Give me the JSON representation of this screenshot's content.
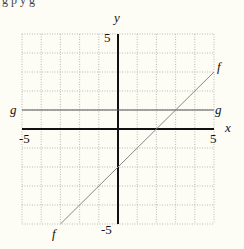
{
  "header_fragment": "g         p                     y   g",
  "chart_data": {
    "type": "line",
    "title": "",
    "xlabel": "x",
    "ylabel": "y",
    "xlim": [
      -5,
      5
    ],
    "ylim": [
      -5,
      5
    ],
    "grid": true,
    "tick_labels": {
      "x_min": "-5",
      "x_max": "5",
      "y_min": "-5",
      "y_max": "5"
    },
    "series": [
      {
        "name": "f",
        "equation": "f(x) = x - 2",
        "x": [
          -3,
          5
        ],
        "y": [
          -5,
          3
        ],
        "color": "#888888"
      },
      {
        "name": "g",
        "equation": "g(x) = 1",
        "x": [
          -5,
          5
        ],
        "y": [
          1,
          1
        ],
        "color": "#555555"
      }
    ]
  },
  "labels": {
    "y_axis": "y",
    "x_axis": "x",
    "y_top": "5",
    "y_bottom": "-5",
    "x_left": "-5",
    "x_right": "5",
    "f_top": "f",
    "f_bottom": "f",
    "g_left": "g",
    "g_right": "g"
  }
}
